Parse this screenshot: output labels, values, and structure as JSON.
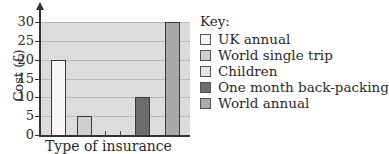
{
  "chart_data": {
    "type": "bar",
    "title": "",
    "xlabel": "Type of insurance",
    "ylabel": "Cost (£)",
    "ylim": [
      0,
      30
    ],
    "yticks": [
      0,
      5,
      10,
      15,
      20,
      25,
      30
    ],
    "grid": true,
    "legend_position": "right",
    "legend_title": "Key:",
    "categories": [
      "UK annual",
      "World single trip",
      "Children",
      "One month back-packing",
      "World annual"
    ],
    "values": [
      20,
      5,
      0,
      10,
      30
    ],
    "colors": [
      "#f6f6f6",
      "#cfcfcf",
      "#e4e4e4",
      "#6c6c6c",
      "#a9a9a9"
    ]
  },
  "axis": {
    "y_title": "Cost (£)",
    "x_title": "Type of insurance",
    "tick_labels": [
      "0",
      "5",
      "10",
      "15",
      "20",
      "25",
      "30"
    ]
  },
  "legend": {
    "title": "Key:",
    "items": [
      {
        "label": "UK annual",
        "color": "#f6f6f6"
      },
      {
        "label": "World single trip",
        "color": "#cfcfcf"
      },
      {
        "label": "Children",
        "color": "#e4e4e4"
      },
      {
        "label": "One month back-packing",
        "color": "#6c6c6c"
      },
      {
        "label": "World annual",
        "color": "#a9a9a9"
      }
    ]
  }
}
